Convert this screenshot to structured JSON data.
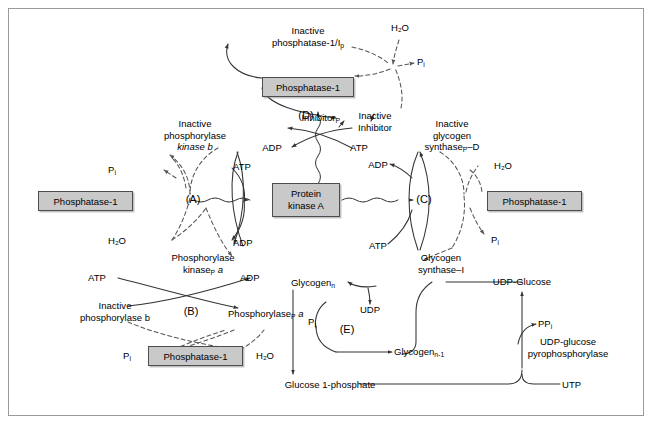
{
  "figure": {
    "border_color": "#9a9a9a",
    "background": "#ffffff"
  },
  "style": {
    "enzyme_box_fill": "#c9c9c9",
    "enzyme_box_border": "#4d4d4d",
    "line_color": "#333333",
    "text_color": "#000000"
  },
  "enzyme_boxes": [
    {
      "id": "phosphatase-top",
      "label": "Phosphatase-1"
    },
    {
      "id": "phosphatase-left",
      "label": "Phosphatase-1"
    },
    {
      "id": "phosphatase-right",
      "label": "Phosphatase-1"
    },
    {
      "id": "phosphatase-bottom",
      "label": "Phosphatase-1"
    },
    {
      "id": "protein-kinase-a",
      "label_line1": "Protein",
      "label_line2": "kinase A"
    }
  ],
  "regions": {
    "a": "(A)",
    "b": "(B)",
    "c": "(C)",
    "d": "(D)",
    "e": "(E)"
  },
  "labels": {
    "inactive_phosphatase_line1": "Inactive",
    "inactive_phosphatase_line2": "phosphatase-1/I",
    "inactive_phosphatase_sub": "p",
    "h2o_top": "H₂O",
    "pi_top": "P",
    "pi_sub": "i",
    "inhibitor_p": "Inhibitor",
    "inhibitor_p_sub": "P",
    "inactive_inhibitor_line1": "Inactive",
    "inactive_inhibitor_line2": "Inhibitor",
    "adp_d_left": "ADP",
    "atp_d_right": "ATP",
    "inactive_phos_kinase_line1": "Inactive",
    "inactive_phos_kinase_line2": "phosphorylase",
    "inactive_phos_kinase_line3": "kinase b",
    "pi_left": "P",
    "h2o_left": "H₂O",
    "atp_a": "ATP",
    "adp_a": "ADP",
    "phosphorylase_kinase_line1": "Phosphorylase",
    "phosphorylase_kinase_line2": "kinase",
    "phosphorylase_kinase_sub": "P",
    "phosphorylase_kinase_suffix": " a",
    "atp_b": "ATP",
    "adp_b": "ADP",
    "inactive_phosphorylase_line1": "Inactive",
    "inactive_phosphorylase_line2": "phosphorylase b",
    "phosphorylase_p_a": "Phosphorylase",
    "phosphorylase_p_a_sub": "P",
    "phosphorylase_p_a_suffix": " a",
    "pi_bottom_left": "P",
    "h2o_bottom_left": "H₂O",
    "adp_c": "ADP",
    "atp_c": "ATP",
    "inactive_glyc_synthase_line1": "Inactive",
    "inactive_glyc_synthase_line2": "glycogen",
    "inactive_glyc_synthase_line3": "synthase",
    "inactive_glyc_synthase_sub": "P",
    "inactive_glyc_synthase_suffix": "–D",
    "h2o_right": "H₂O",
    "pi_right": "P",
    "glycogen_synthase_i_line1": "Glycogen",
    "glycogen_synthase_i_line2": "synthase–I",
    "glycogen_n": "Glycogen",
    "glycogen_n_sub": "n",
    "glycogen_n1": "Glycogen",
    "glycogen_n1_sub": "n-1",
    "udp": "UDP",
    "udp_glucose": "UDP-Glucose",
    "pi_e": "P",
    "glucose_1_phosphate": "Glucose 1-phosphate",
    "ppi": "PP",
    "ppi_sub": "i",
    "udp_glucose_pyrophosphorylase_line1": "UDP-glucose",
    "udp_glucose_pyrophosphorylase_line2": "pyrophosphorylase",
    "utp": "UTP"
  }
}
